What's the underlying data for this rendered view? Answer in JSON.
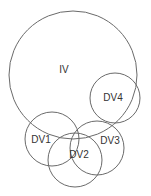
{
  "diagram": {
    "type": "venn",
    "stroke_color": "#6a6a6a",
    "label_color": "#333333",
    "circles": [
      {
        "id": "iv",
        "label": "IV",
        "cx": 73,
        "cy": 75,
        "r": 64,
        "lx": 64,
        "ly": 70
      },
      {
        "id": "dv4",
        "label": "DV4",
        "cx": 115,
        "cy": 98,
        "r": 25,
        "lx": 113,
        "ly": 98
      },
      {
        "id": "dv1",
        "label": "DV1",
        "cx": 52,
        "cy": 139,
        "r": 27,
        "lx": 41,
        "ly": 140
      },
      {
        "id": "dv3",
        "label": "DV3",
        "cx": 97,
        "cy": 148,
        "r": 27,
        "lx": 110,
        "ly": 141
      },
      {
        "id": "dv2",
        "label": "DV2",
        "cx": 75,
        "cy": 160,
        "r": 27,
        "lx": 79,
        "ly": 155
      }
    ]
  }
}
